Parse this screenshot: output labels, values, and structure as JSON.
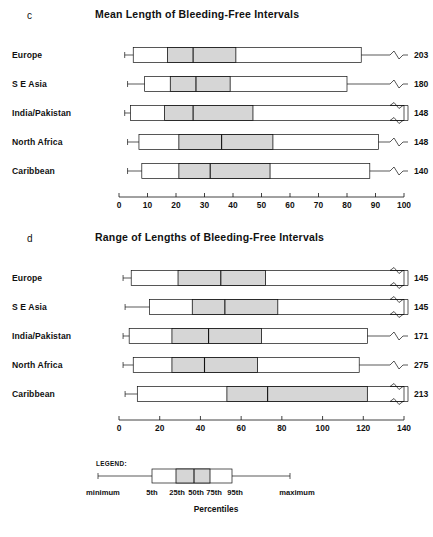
{
  "figure": {
    "caption": ""
  },
  "panels": [
    {
      "letter": "c",
      "title": "Mean Length of Bleeding-Free Intervals",
      "axis": {
        "min": 0,
        "max": 100,
        "ticks": [
          0,
          10,
          20,
          30,
          40,
          50,
          60,
          70,
          80,
          90,
          100
        ]
      },
      "rows": [
        {
          "label": "Europe",
          "value": "203"
        },
        {
          "label": "S E Asia",
          "value": "180"
        },
        {
          "label": "India/Pakistan",
          "value": "148"
        },
        {
          "label": "North Africa",
          "value": "148"
        },
        {
          "label": "Caribbean",
          "value": "140"
        }
      ]
    },
    {
      "letter": "d",
      "title": "Range of Lengths of Bleeding-Free Intervals",
      "axis": {
        "min": 0,
        "max": 140,
        "ticks": [
          0,
          20,
          40,
          60,
          80,
          100,
          120,
          140
        ]
      },
      "rows": [
        {
          "label": "Europe",
          "value": "145"
        },
        {
          "label": "S E Asia",
          "value": "145"
        },
        {
          "label": "India/Pakistan",
          "value": "171"
        },
        {
          "label": "North Africa",
          "value": "275"
        },
        {
          "label": "Caribbean",
          "value": "213"
        }
      ]
    }
  ],
  "legend": {
    "title": "LEGEND:",
    "axis_title": "Percentiles",
    "min_label": "minimum",
    "max_label": "maximum",
    "percentile_labels": [
      "5th",
      "25th",
      "50th",
      "75th",
      "95th"
    ]
  },
  "chart_data": [
    {
      "type": "boxplot",
      "panel": "c",
      "title": "Mean Length of Bleeding-Free Intervals",
      "xlabel": "",
      "ylabel": "",
      "xlim": [
        0,
        100
      ],
      "xticks": [
        0,
        10,
        20,
        30,
        40,
        50,
        60,
        70,
        80,
        90,
        100
      ],
      "grid": false,
      "truncated_max_marker": true,
      "box_convention": [
        "minimum",
        "5th",
        "25th",
        "50th",
        "75th",
        "95th",
        "maximum"
      ],
      "categories": [
        "Europe",
        "S E Asia",
        "India/Pakistan",
        "North Africa",
        "Caribbean"
      ],
      "boxes": [
        {
          "category": "Europe",
          "minimum": 2,
          "p5": 5,
          "p25": 17,
          "p50": 26,
          "p75": 41,
          "p95": 85,
          "maximum": 203,
          "maximum_label": "203",
          "max_truncated": true,
          "box_truncated": false
        },
        {
          "category": "S E Asia",
          "minimum": 3,
          "p5": 9,
          "p25": 18,
          "p50": 27,
          "p75": 39,
          "p95": 80,
          "maximum": 180,
          "maximum_label": "180",
          "max_truncated": true,
          "box_truncated": false
        },
        {
          "category": "India/Pakistan",
          "minimum": 2,
          "p5": 4,
          "p25": 16,
          "p50": 26,
          "p75": 47,
          "p95": 100,
          "maximum": 148,
          "maximum_label": "148",
          "max_truncated": true,
          "box_truncated": true
        },
        {
          "category": "North Africa",
          "minimum": 3,
          "p5": 7,
          "p25": 21,
          "p50": 36,
          "p75": 54,
          "p95": 91,
          "maximum": 148,
          "maximum_label": "148",
          "max_truncated": true,
          "box_truncated": false
        },
        {
          "category": "Caribbean",
          "minimum": 3,
          "p5": 8,
          "p25": 21,
          "p50": 32,
          "p75": 53,
          "p95": 88,
          "maximum": 140,
          "maximum_label": "140",
          "max_truncated": true,
          "box_truncated": false
        }
      ]
    },
    {
      "type": "boxplot",
      "panel": "d",
      "title": "Range of Lengths of Bleeding-Free Intervals",
      "xlabel": "",
      "ylabel": "",
      "xlim": [
        0,
        140
      ],
      "xticks": [
        0,
        20,
        40,
        60,
        80,
        100,
        120,
        140
      ],
      "grid": false,
      "truncated_max_marker": true,
      "box_convention": [
        "minimum",
        "5th",
        "25th",
        "50th",
        "75th",
        "95th",
        "maximum"
      ],
      "categories": [
        "Europe",
        "S E Asia",
        "India/Pakistan",
        "North Africa",
        "Caribbean"
      ],
      "boxes": [
        {
          "category": "Europe",
          "minimum": 2,
          "p5": 6,
          "p25": 29,
          "p50": 50,
          "p75": 72,
          "p95": 140,
          "maximum": 145,
          "maximum_label": "145",
          "max_truncated": true,
          "box_truncated": true
        },
        {
          "category": "S E Asia",
          "minimum": 3,
          "p5": 15,
          "p25": 36,
          "p50": 52,
          "p75": 78,
          "p95": 140,
          "maximum": 145,
          "maximum_label": "145",
          "max_truncated": true,
          "box_truncated": true
        },
        {
          "category": "India/Pakistan",
          "minimum": 2,
          "p5": 5,
          "p25": 26,
          "p50": 44,
          "p75": 70,
          "p95": 122,
          "maximum": 171,
          "maximum_label": "171",
          "max_truncated": true,
          "box_truncated": false
        },
        {
          "category": "North Africa",
          "minimum": 2,
          "p5": 7,
          "p25": 26,
          "p50": 42,
          "p75": 68,
          "p95": 118,
          "maximum": 275,
          "maximum_label": "275",
          "max_truncated": true,
          "box_truncated": false
        },
        {
          "category": "Caribbean",
          "minimum": 3,
          "p5": 9,
          "p25": 53,
          "p50": 73,
          "p75": 122,
          "p95": 140,
          "maximum": 213,
          "maximum_label": "213",
          "max_truncated": true,
          "box_truncated": true
        }
      ]
    }
  ]
}
